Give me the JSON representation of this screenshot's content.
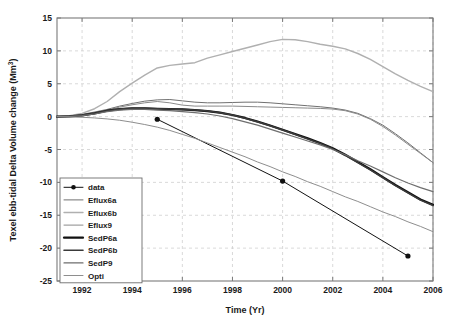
{
  "chart_data": {
    "type": "line",
    "title": "",
    "xlabel": "Time (Yr)",
    "ylabel": "Texel ebb-tidal Delta Volume change (Mm 3)",
    "ylabel_main": "Texel ebb-tidal Delta Volume change (Mm",
    "ylabel_sup": "3",
    "ylabel_tail": ")",
    "xlim": [
      1991,
      2006
    ],
    "ylim": [
      -25,
      15
    ],
    "xticks": [
      1992,
      1994,
      1996,
      1998,
      2000,
      2002,
      2004,
      2006
    ],
    "xtick_labels": [
      "1992",
      "1994",
      "1996",
      "1998",
      "2000",
      "2002",
      "2004",
      "2006"
    ],
    "yticks": [
      -25,
      -20,
      -15,
      -10,
      -5,
      0,
      5,
      10,
      15
    ],
    "ytick_labels": [
      "-25",
      "-20",
      "-15",
      "-10",
      "-5",
      "0",
      "5",
      "10",
      "15"
    ],
    "grid": true,
    "grid_style": "dashed",
    "legend_position": "lower-left",
    "series": [
      {
        "name": "data",
        "style": "line-marker",
        "color": "#111111",
        "width": 1.0,
        "marker": "circle",
        "x": [
          1995,
          2000,
          2005
        ],
        "y": [
          -0.4,
          -9.8,
          -21.2
        ]
      },
      {
        "name": "Eflux6a",
        "style": "line",
        "color": "#707070",
        "width": 1.0,
        "x": [
          1991,
          1991.5,
          1992,
          1992.5,
          1993,
          1993.5,
          1994,
          1994.5,
          1995,
          1995.5,
          1996,
          1996.5,
          1997,
          1997.5,
          1998,
          1998.5,
          1999,
          1999.5,
          2000,
          2000.5,
          2001,
          2001.5,
          2002,
          2002.5,
          2003,
          2003.5,
          2004,
          2004.5,
          2005,
          2005.5,
          2006
        ],
        "y": [
          0.0,
          0.1,
          0.35,
          0.7,
          1.1,
          1.6,
          2.0,
          2.35,
          2.55,
          2.6,
          2.4,
          2.2,
          2.1,
          2.1,
          2.15,
          2.2,
          2.2,
          2.1,
          1.95,
          1.8,
          1.65,
          1.5,
          1.3,
          1.0,
          0.5,
          -0.3,
          -1.3,
          -2.6,
          -4.0,
          -5.5,
          -7.0
        ]
      },
      {
        "name": "Eflux6b",
        "style": "line",
        "color": "#b0b0b0",
        "width": 1.4,
        "x": [
          1991,
          1991.5,
          1992,
          1992.5,
          1993,
          1993.5,
          1994,
          1994.5,
          1995,
          1995.5,
          1996,
          1996.5,
          1997,
          1997.5,
          1998,
          1998.5,
          1999,
          1999.5,
          2000,
          2000.5,
          2001,
          2001.5,
          2002,
          2002.5,
          2003,
          2003.5,
          2004,
          2004.5,
          2005,
          2005.5,
          2006
        ],
        "y": [
          0.0,
          0.15,
          0.5,
          1.2,
          2.3,
          3.8,
          5.1,
          6.3,
          7.4,
          7.8,
          8.0,
          8.2,
          8.9,
          9.4,
          9.9,
          10.4,
          10.9,
          11.4,
          11.75,
          11.7,
          11.4,
          11.0,
          10.7,
          10.3,
          9.6,
          8.7,
          7.6,
          6.5,
          5.5,
          4.6,
          3.8
        ]
      },
      {
        "name": "Eflux9",
        "style": "line",
        "color": "#8a8a8a",
        "width": 1.0,
        "x": [
          1991,
          1991.5,
          1992,
          1992.5,
          1993,
          1993.5,
          1994,
          1994.5,
          1995,
          1995.5,
          1996,
          1996.5,
          1997,
          1997.5,
          1998,
          1998.5,
          1999,
          1999.5,
          2000,
          2000.5,
          2001,
          2001.5,
          2002,
          2002.5,
          2003,
          2003.5,
          2004,
          2004.5,
          2005,
          2005.5,
          2006
        ],
        "y": [
          0.0,
          0.1,
          0.3,
          0.65,
          1.0,
          1.45,
          1.8,
          2.1,
          2.3,
          2.1,
          1.75,
          1.6,
          1.6,
          1.6,
          1.6,
          1.55,
          1.5,
          1.45,
          1.4,
          1.35,
          1.3,
          1.25,
          1.15,
          0.9,
          0.4,
          -0.4,
          -1.5,
          -2.8,
          -4.2,
          -5.6,
          -7.0
        ]
      },
      {
        "name": "SedP6a",
        "style": "line",
        "color": "#111111",
        "width": 2.2,
        "x": [
          1991,
          1991.5,
          1992,
          1992.5,
          1993,
          1993.5,
          1994,
          1994.5,
          1995,
          1995.5,
          1996,
          1996.5,
          1997,
          1997.5,
          1998,
          1998.5,
          1999,
          1999.5,
          2000,
          2000.5,
          2001,
          2001.5,
          2002,
          2002.5,
          2003,
          2003.5,
          2004,
          2004.5,
          2005,
          2005.5,
          2006
        ],
        "y": [
          0.0,
          0.05,
          0.2,
          0.5,
          0.9,
          1.15,
          1.25,
          1.25,
          1.2,
          1.15,
          1.1,
          1.0,
          0.85,
          0.6,
          0.25,
          -0.2,
          -0.75,
          -1.35,
          -2.0,
          -2.65,
          -3.3,
          -4.0,
          -4.8,
          -5.8,
          -6.9,
          -8.0,
          -9.2,
          -10.4,
          -11.5,
          -12.6,
          -13.4
        ]
      },
      {
        "name": "SedP6b",
        "style": "line",
        "color": "#3a3a3a",
        "width": 1.6,
        "x": [
          1991,
          1991.5,
          1992,
          1992.5,
          1993,
          1993.5,
          1994,
          1994.5,
          1995,
          1995.5,
          1996,
          1996.5,
          1997,
          1997.5,
          1998,
          1998.5,
          1999,
          1999.5,
          2000,
          2000.5,
          2001,
          2001.5,
          2002,
          2002.5,
          2003,
          2003.5,
          2004,
          2004.5,
          2005,
          2005.5,
          2006
        ],
        "y": [
          0.0,
          0.05,
          0.2,
          0.5,
          0.9,
          1.15,
          1.25,
          1.25,
          1.2,
          1.15,
          1.1,
          1.0,
          0.85,
          0.6,
          0.25,
          -0.25,
          -0.8,
          -1.4,
          -2.05,
          -2.7,
          -3.4,
          -4.1,
          -4.9,
          -5.9,
          -7.0,
          -8.1,
          -9.3,
          -10.5,
          -11.6,
          -12.7,
          -13.5
        ]
      },
      {
        "name": "SedP9",
        "style": "line",
        "color": "#6e6e6e",
        "width": 1.2,
        "x": [
          1991,
          1991.5,
          1992,
          1992.5,
          1993,
          1993.5,
          1994,
          1994.5,
          1995,
          1995.5,
          1996,
          1996.5,
          1997,
          1997.5,
          1998,
          1998.5,
          1999,
          1999.5,
          2000,
          2000.5,
          2001,
          2001.5,
          2002,
          2002.5,
          2003,
          2003.5,
          2004,
          2004.5,
          2005,
          2005.5,
          2006
        ],
        "y": [
          0.0,
          0.05,
          0.15,
          0.4,
          0.75,
          1.0,
          1.1,
          1.1,
          1.0,
          0.9,
          0.75,
          0.6,
          0.4,
          0.1,
          -0.3,
          -0.8,
          -1.3,
          -1.9,
          -2.5,
          -3.1,
          -3.7,
          -4.3,
          -5.0,
          -5.8,
          -6.7,
          -7.5,
          -8.4,
          -9.3,
          -10.1,
          -10.8,
          -11.4
        ]
      },
      {
        "name": "Opti",
        "style": "line",
        "color": "#8e8e8e",
        "width": 1.0,
        "x": [
          1991,
          1991.5,
          1992,
          1992.5,
          1993,
          1993.5,
          1994,
          1994.5,
          1995,
          1995.5,
          1996,
          1996.5,
          1997,
          1997.5,
          1998,
          1998.5,
          1999,
          1999.5,
          2000,
          2000.5,
          2001,
          2001.5,
          2002,
          2002.5,
          2003,
          2003.5,
          2004,
          2004.5,
          2005,
          2005.5,
          2006
        ],
        "y": [
          0.0,
          -0.05,
          -0.1,
          -0.2,
          -0.35,
          -0.55,
          -0.85,
          -1.2,
          -1.6,
          -2.1,
          -2.7,
          -3.3,
          -4.0,
          -4.7,
          -5.4,
          -6.1,
          -6.9,
          -7.6,
          -8.4,
          -9.1,
          -9.9,
          -10.6,
          -11.4,
          -12.2,
          -12.9,
          -13.7,
          -14.5,
          -15.2,
          -16.0,
          -16.7,
          -17.5
        ]
      }
    ],
    "legend_entries": [
      {
        "label": "data",
        "color": "#111111",
        "width": 1.0,
        "marker": true
      },
      {
        "label": "Eflux6a",
        "color": "#707070",
        "width": 1.0,
        "marker": false
      },
      {
        "label": "Eflux6b",
        "color": "#b0b0b0",
        "width": 1.4,
        "marker": false
      },
      {
        "label": "Eflux9",
        "color": "#8a8a8a",
        "width": 1.0,
        "marker": false
      },
      {
        "label": "SedP6a",
        "color": "#111111",
        "width": 2.2,
        "marker": false
      },
      {
        "label": "SedP6b",
        "color": "#3a3a3a",
        "width": 1.6,
        "marker": false
      },
      {
        "label": "SedP9",
        "color": "#6e6e6e",
        "width": 1.2,
        "marker": false
      },
      {
        "label": "Opti",
        "color": "#8e8e8e",
        "width": 1.0,
        "marker": false
      }
    ]
  },
  "colors": {
    "axis": "#7a7a7a",
    "grid": "#c8c8c8",
    "text": "#1a1a1a",
    "background": "#ffffff"
  }
}
